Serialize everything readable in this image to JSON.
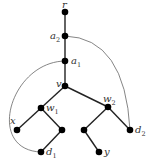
{
  "diagram": {
    "type": "tree-with-extra-arcs",
    "nodes": [
      {
        "id": "r",
        "label": "r",
        "sub": "",
        "x": 65,
        "y": 12,
        "lx": 62,
        "ly": 8,
        "anchor": "start"
      },
      {
        "id": "a2",
        "label": "a",
        "sub": "2",
        "x": 65,
        "y": 36,
        "lx": 50,
        "ly": 39,
        "anchor": "start"
      },
      {
        "id": "a1",
        "label": "a",
        "sub": "1",
        "x": 65,
        "y": 61,
        "lx": 71,
        "ly": 64,
        "anchor": "start"
      },
      {
        "id": "v",
        "label": "v",
        "sub": "",
        "x": 65,
        "y": 86,
        "lx": 56,
        "ly": 87,
        "anchor": "start"
      },
      {
        "id": "w1",
        "label": "w",
        "sub": "1",
        "x": 41,
        "y": 108,
        "lx": 46,
        "ly": 111,
        "anchor": "start"
      },
      {
        "id": "w2",
        "label": "w",
        "sub": "2",
        "x": 108,
        "y": 107,
        "lx": 103,
        "ly": 102,
        "anchor": "start"
      },
      {
        "id": "x",
        "label": "x",
        "sub": "",
        "x": 17,
        "y": 130,
        "lx": 10,
        "ly": 124,
        "anchor": "start"
      },
      {
        "id": "n1",
        "label": "",
        "sub": "",
        "x": 62,
        "y": 130,
        "lx": 0,
        "ly": 0,
        "anchor": "start"
      },
      {
        "id": "d1",
        "label": "d",
        "sub": "1",
        "x": 41,
        "y": 152,
        "lx": 46,
        "ly": 155,
        "anchor": "start"
      },
      {
        "id": "n2",
        "label": "",
        "sub": "",
        "x": 84,
        "y": 130,
        "lx": 0,
        "ly": 0,
        "anchor": "start"
      },
      {
        "id": "y",
        "label": "y",
        "sub": "",
        "x": 99,
        "y": 152,
        "lx": 104,
        "ly": 155,
        "anchor": "start"
      },
      {
        "id": "d2",
        "label": "d",
        "sub": "2",
        "x": 130,
        "y": 130,
        "lx": 135,
        "ly": 133,
        "anchor": "start"
      }
    ],
    "edges": [
      [
        "r",
        "a2"
      ],
      [
        "a2",
        "a1"
      ],
      [
        "a1",
        "v"
      ],
      [
        "v",
        "w1"
      ],
      [
        "v",
        "w2"
      ],
      [
        "w1",
        "x"
      ],
      [
        "w1",
        "n1"
      ],
      [
        "n1",
        "d1"
      ],
      [
        "w2",
        "n2"
      ],
      [
        "n2",
        "y"
      ],
      [
        "w2",
        "d2"
      ]
    ],
    "arcs": [
      {
        "from": "a2",
        "to": "d2",
        "path": "M65,36 Q125,38 130,130"
      },
      {
        "from": "a1",
        "to": "d1",
        "path": "M65,61 C10,62 -15,150 41,152"
      }
    ]
  }
}
